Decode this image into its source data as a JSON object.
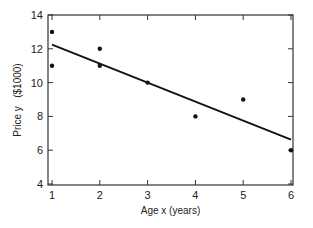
{
  "chart_data": {
    "type": "scatter",
    "title": "",
    "xlabel": "Age x   (years)",
    "ylabel": "Price y   ($1000)",
    "xlim": [
      1,
      6
    ],
    "ylim": [
      4,
      14
    ],
    "x_ticks": [
      1,
      2,
      3,
      4,
      5,
      6
    ],
    "y_ticks": [
      4,
      6,
      8,
      10,
      12,
      14
    ],
    "grid": false,
    "legend": null,
    "series": [
      {
        "name": "observations",
        "type": "scatter",
        "points": [
          {
            "x": 1,
            "y": 13
          },
          {
            "x": 1,
            "y": 11
          },
          {
            "x": 2,
            "y": 12
          },
          {
            "x": 2,
            "y": 11
          },
          {
            "x": 3,
            "y": 10
          },
          {
            "x": 4,
            "y": 8
          },
          {
            "x": 5,
            "y": 9
          },
          {
            "x": 6,
            "y": 6
          }
        ]
      },
      {
        "name": "fitted line",
        "type": "line",
        "points": [
          {
            "x": 1,
            "y": 12.25
          },
          {
            "x": 6,
            "y": 6.625
          }
        ]
      }
    ]
  },
  "labels": {
    "xlabel": "Age x   (years)",
    "ylabel": "Price y   ($1000)"
  }
}
